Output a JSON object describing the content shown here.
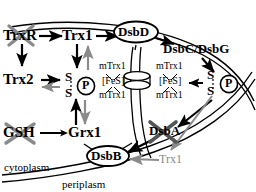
{
  "diagram": {
    "compartments": {
      "cytoplasm_label": "cytoplasm",
      "periplasm_label": "periplasm"
    },
    "colors": {
      "ink": "#000000",
      "knocked_out": "#8a8a8a",
      "inhibited_arrow": "#8a8a8a",
      "background": "#ffffff"
    },
    "nodes": {
      "trxr": {
        "label": "TrxR",
        "crossed_out": true
      },
      "trx1_top": {
        "label": "Trx1",
        "crossed_out": false
      },
      "trx2": {
        "label": "Trx2",
        "crossed_out": false
      },
      "gsh": {
        "label": "GSH",
        "crossed_out": true
      },
      "grx1": {
        "label": "Grx1",
        "crossed_out": false
      },
      "dsbd": {
        "label": "DsbD",
        "shape": "ellipse",
        "crossed_out": false
      },
      "dsbb": {
        "label": "DsbB",
        "shape": "ellipse",
        "crossed_out": false
      },
      "dsbcdsbg": {
        "label": "DsbC/DsbG",
        "crossed_out": false
      },
      "dsba": {
        "label": "DsbA",
        "crossed_out": true
      },
      "trx1_periplasm": {
        "label": "Trx1",
        "crossed_out": false,
        "color": "#8a8a8a"
      }
    },
    "substrates": {
      "left": {
        "s_top": "S",
        "s_bottom": "S",
        "phospho": "P"
      },
      "right": {
        "s_top": "S",
        "s_bottom": "S",
        "phospho": "P"
      }
    },
    "transporter": {
      "left_stack": [
        "mTrx1",
        "[FeS]",
        "mTrx1"
      ],
      "right_stack": [
        "mTrx1",
        "[FeS]",
        "mTrx1"
      ],
      "shape": "membrane-channel-disks"
    }
  }
}
